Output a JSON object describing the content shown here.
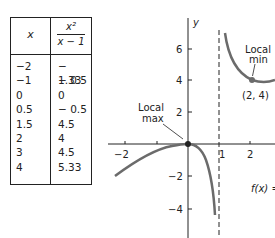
{
  "table": {
    "header_x": "x",
    "header_f_num": "x²",
    "header_f_den": "x − 1",
    "rows": [
      {
        "x": "−2",
        "f": "− 1.33"
      },
      {
        "x": "−1",
        "f": "− 0.5"
      },
      {
        "x": "0",
        "f": "0"
      },
      {
        "x": "0.5",
        "f": "− 0.5"
      },
      {
        "x": "1.5",
        "f": "4.5"
      },
      {
        "x": "2",
        "f": "4"
      },
      {
        "x": "3",
        "f": "4.5"
      },
      {
        "x": "4",
        "f": "5.33"
      }
    ]
  },
  "graph": {
    "y_axis_label": "y",
    "x_ticks": [
      "−2",
      "1",
      "2"
    ],
    "y_ticks": [
      "6",
      "4",
      "2",
      "−2",
      "−4"
    ],
    "local_max_label_1": "Local",
    "local_max_label_2": "max",
    "local_min_label_1": "Local",
    "local_min_label_2": "min",
    "local_min_point": "(2, 4)",
    "function_label": "f(x) =",
    "curve_color": "#6b6b6b"
  }
}
